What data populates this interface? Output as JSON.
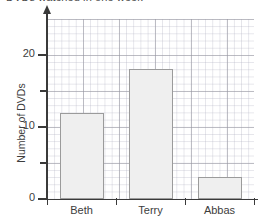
{
  "chart_data": {
    "type": "bar",
    "title": "DVDs watched in one week",
    "title_clipped": true,
    "xlabel": "",
    "ylabel": "Number of DVDs",
    "categories": [
      "Beth",
      "Terry",
      "Abbas"
    ],
    "values": [
      12,
      18,
      3
    ],
    "ylim": [
      0,
      25
    ],
    "ytick_labels": [
      "0",
      "10",
      "20"
    ],
    "ytick_values": [
      0,
      10,
      20
    ],
    "yminor_tick_values": [
      5,
      15
    ],
    "grid": true,
    "grid_major_step": 5,
    "grid_minor_step": 1,
    "legend": "none",
    "bar_fill_color": "#efefef",
    "bar_border_color": "#9b9b9b",
    "axis_color": "#3a3a3a",
    "grid_major_color": "#9696a0",
    "grid_minor_color": "#b4b4c3"
  }
}
